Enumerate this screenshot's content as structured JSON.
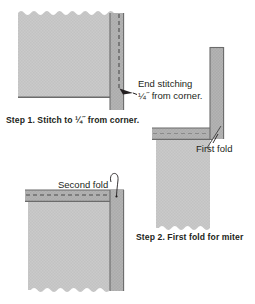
{
  "figure": {
    "background_color": "#ffffff",
    "fabric_color": "#c9c9c9",
    "binding_color": "#b0b0b0",
    "line_color": "#58595b",
    "text_color": "#231f20"
  },
  "labels": {
    "end_stitching_line1": "End stitching",
    "end_stitching_line2": "¼˝ from corner.",
    "step1": "Step 1. Stitch to ¼˝ from corner.",
    "first_fold": "First fold",
    "second_fold": "Second fold",
    "step2": "Step 2. First fold for miter"
  },
  "diagrams": [
    {
      "name": "step-1-stitch-to-corner",
      "caption": "Step 1. Stitch to ¼˝ from corner.",
      "annotations": [
        "End stitching ¼˝ from corner."
      ],
      "elements": [
        "quilt-panel",
        "binding-strip",
        "stitching-dashed-line",
        "arrow-to-stitch-end"
      ]
    },
    {
      "name": "step-2-first-fold-for-miter",
      "caption": "Step 2. First fold for miter",
      "annotations": [
        "First fold"
      ],
      "elements": [
        "quilt-panel",
        "horizontal-binding-strip",
        "vertical-binding-strip",
        "stitching-dashed-line",
        "diagonal-fold-line",
        "leader-line"
      ]
    },
    {
      "name": "second-fold-detail",
      "caption": "",
      "annotations": [
        "Second fold"
      ],
      "elements": [
        "quilt-panel",
        "horizontal-binding-strip",
        "vertical-binding-strip",
        "stitching-dashed-line",
        "curved-leader-line"
      ]
    }
  ]
}
